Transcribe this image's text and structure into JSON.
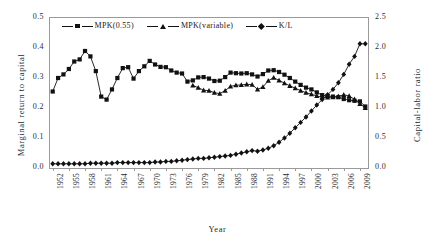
{
  "chart_data": {
    "type": "line",
    "title": "",
    "xlabel": "Year",
    "ylabel": "Marginal return to capital",
    "ylabel_secondary": "Capital-labor ratio",
    "ylim": [
      0.0,
      0.5
    ],
    "ylim_secondary": [
      0.0,
      2.5
    ],
    "yticks": [
      "0.0",
      "0.1",
      "0.2",
      "0.3",
      "0.4",
      "0.5"
    ],
    "yticks_secondary": [
      "0.0",
      "0.5",
      "1.0",
      "1.5",
      "2.0",
      "2.5"
    ],
    "grid": false,
    "legend_position": "top-center",
    "xlim": [
      1952,
      2010
    ],
    "x": [
      1952,
      1953,
      1954,
      1955,
      1956,
      1957,
      1958,
      1959,
      1960,
      1961,
      1962,
      1963,
      1964,
      1965,
      1966,
      1967,
      1968,
      1969,
      1970,
      1971,
      1972,
      1973,
      1974,
      1975,
      1976,
      1977,
      1978,
      1979,
      1980,
      1981,
      1982,
      1983,
      1984,
      1985,
      1986,
      1987,
      1988,
      1989,
      1990,
      1991,
      1992,
      1993,
      1994,
      1995,
      1996,
      1997,
      1998,
      1999,
      2000,
      2001,
      2002,
      2003,
      2004,
      2005,
      2006,
      2007,
      2008,
      2009,
      2010
    ],
    "xticks": [
      "1952",
      "1955",
      "1958",
      "1961",
      "1964",
      "1967",
      "1970",
      "1973",
      "1976",
      "1979",
      "1982",
      "1985",
      "1988",
      "1991",
      "1994",
      "1997",
      "2000",
      "2003",
      "2006",
      "2009"
    ],
    "series": [
      {
        "name": "MPK(0.55)",
        "marker": "square",
        "axis": "left",
        "values": [
          0.255,
          0.3,
          0.312,
          0.33,
          0.355,
          0.362,
          0.39,
          0.372,
          0.323,
          0.238,
          0.228,
          0.262,
          0.3,
          0.333,
          0.336,
          0.298,
          0.323,
          0.339,
          0.357,
          0.345,
          0.337,
          0.336,
          0.325,
          0.318,
          0.315,
          0.288,
          0.292,
          0.302,
          0.303,
          0.298,
          0.29,
          0.291,
          0.303,
          0.318,
          0.316,
          0.315,
          0.316,
          0.312,
          0.305,
          0.313,
          0.325,
          0.326,
          0.32,
          0.311,
          0.3,
          0.288,
          0.277,
          0.268,
          0.262,
          0.252,
          0.243,
          0.24,
          0.238,
          0.236,
          0.23,
          0.226,
          0.224,
          0.222,
          0.205
        ]
      },
      {
        "name": "MPK(variable)",
        "marker": "triangle",
        "axis": "left",
        "values": [
          null,
          null,
          null,
          null,
          null,
          null,
          null,
          null,
          null,
          null,
          null,
          null,
          null,
          null,
          null,
          null,
          null,
          null,
          null,
          null,
          null,
          null,
          null,
          null,
          null,
          null,
          0.275,
          0.268,
          0.259,
          0.258,
          0.251,
          0.248,
          0.258,
          0.272,
          0.276,
          0.277,
          0.279,
          0.278,
          0.262,
          0.27,
          0.291,
          0.301,
          0.292,
          0.283,
          0.274,
          0.266,
          0.258,
          0.251,
          0.246,
          0.24,
          0.236,
          0.235,
          0.236,
          0.239,
          0.244,
          0.24,
          0.229,
          0.214,
          0.2
        ]
      },
      {
        "name": "K/L",
        "marker": "diamond",
        "axis": "right",
        "values": [
          0.07,
          0.07,
          0.07,
          0.07,
          0.07,
          0.07,
          0.07,
          0.08,
          0.08,
          0.08,
          0.08,
          0.08,
          0.09,
          0.09,
          0.09,
          0.09,
          0.09,
          0.09,
          0.09,
          0.1,
          0.1,
          0.11,
          0.11,
          0.12,
          0.13,
          0.14,
          0.15,
          0.16,
          0.16,
          0.17,
          0.18,
          0.19,
          0.2,
          0.21,
          0.23,
          0.25,
          0.27,
          0.29,
          0.28,
          0.3,
          0.33,
          0.37,
          0.43,
          0.5,
          0.58,
          0.67,
          0.76,
          0.85,
          0.95,
          1.05,
          1.14,
          1.22,
          1.31,
          1.42,
          1.56,
          1.73,
          1.86,
          2.07,
          2.07
        ]
      }
    ]
  },
  "legend": {
    "items": [
      {
        "label": "MPK(0.55)",
        "marker": "square"
      },
      {
        "label": "MPK(variable)",
        "marker": "triangle"
      },
      {
        "label": "K/L",
        "marker": "diamond"
      }
    ]
  }
}
